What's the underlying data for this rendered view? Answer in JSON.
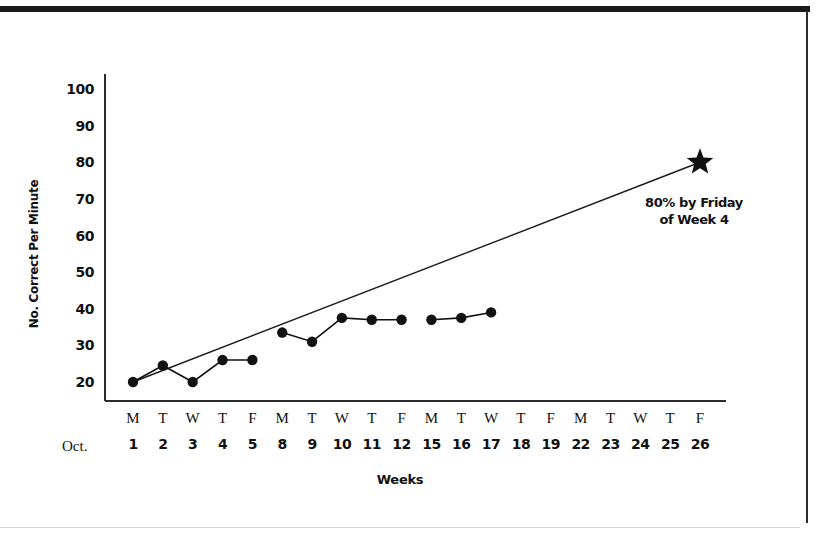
{
  "chart_data": {
    "type": "line",
    "title": "",
    "xlabel": "Weeks",
    "ylabel": "No. Correct Per Minute",
    "ylim": [
      20,
      100
    ],
    "yticks": [
      100,
      90,
      80,
      70,
      60,
      50,
      40,
      30,
      20
    ],
    "grid": false,
    "legend": "none",
    "month_label": "Oct.",
    "x_day_labels": [
      "M",
      "T",
      "W",
      "T",
      "F",
      "M",
      "T",
      "W",
      "T",
      "F",
      "M",
      "T",
      "W",
      "T",
      "F",
      "M",
      "T",
      "W",
      "T",
      "F"
    ],
    "x_date_labels": [
      "1",
      "2",
      "3",
      "4",
      "5",
      "8",
      "9",
      "10",
      "11",
      "12",
      "15",
      "16",
      "17",
      "18",
      "19",
      "22",
      "23",
      "24",
      "25",
      "26"
    ],
    "series": [
      {
        "name": "No. Correct Per Minute",
        "marker": "filled-circle",
        "x": [
          "1",
          "2",
          "3",
          "4",
          "5",
          "8",
          "9",
          "10",
          "11",
          "12",
          "15",
          "16",
          "17"
        ],
        "values": [
          20,
          24.5,
          20,
          26,
          26,
          33.5,
          31,
          37.5,
          37,
          37,
          37,
          37.5,
          39
        ],
        "breaks_after": [
          "5",
          "12"
        ]
      },
      {
        "name": "Aim line to goal",
        "marker": "none",
        "x": [
          "1",
          "26"
        ],
        "values": [
          20,
          80
        ]
      }
    ],
    "goal_marker": {
      "shape": "star",
      "x": "26",
      "value": 80,
      "annotation_line1": "80% by Friday",
      "annotation_line2": "of Week 4"
    },
    "colors": {
      "ink": "#111111",
      "axis": "#2b2b2b",
      "background": "#ffffff"
    }
  }
}
